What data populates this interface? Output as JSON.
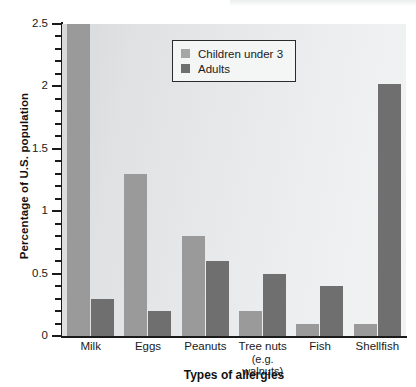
{
  "chart_data": {
    "type": "bar",
    "title": "",
    "xlabel": "Types of allergies",
    "ylabel": "Percentage of U.S. population",
    "categories": [
      "Milk",
      "Eggs",
      "Peanuts",
      "Tree nuts",
      "Fish",
      "Shellfish"
    ],
    "category_sublabels": [
      "",
      "",
      "",
      "(e.g. walnuts)",
      "",
      ""
    ],
    "series": [
      {
        "name": "Children under 3",
        "color": "#9a9a9a",
        "values": [
          2.5,
          1.3,
          0.8,
          0.2,
          0.1,
          0.1
        ]
      },
      {
        "name": "Adults",
        "color": "#6f6f6f",
        "values": [
          0.3,
          0.2,
          0.6,
          0.5,
          0.4,
          2.02
        ]
      }
    ],
    "ylim": [
      0,
      2.5
    ],
    "ytick_labels": [
      "0",
      "0.5",
      "1",
      "1.5",
      "2",
      "2.5"
    ],
    "ytick_values": [
      0,
      0.5,
      1,
      1.5,
      2,
      2.5
    ],
    "yminor_step": 0.1,
    "grid": false,
    "legend_position": "top-center"
  },
  "legend": {
    "entries": [
      {
        "label": "Children under 3"
      },
      {
        "label": "Adults"
      }
    ]
  },
  "axis_titles": {
    "x": "Types of allergies",
    "y": "Percentage of U.S. population"
  }
}
